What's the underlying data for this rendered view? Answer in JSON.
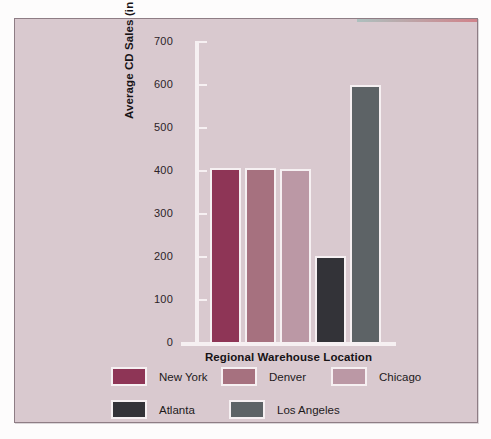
{
  "chart_data": {
    "type": "bar",
    "title": "",
    "xlabel": "Regional Warehouse Location",
    "ylabel": "Average CD Sales (in thousands)",
    "categories": [
      "New York",
      "Denver",
      "Chicago",
      "Atlanta",
      "Los Angeles"
    ],
    "values": [
      400,
      400,
      398,
      195,
      592
    ],
    "ylim": [
      0,
      700
    ],
    "yticks": [
      0,
      100,
      200,
      300,
      400,
      500,
      600,
      700
    ],
    "ytick_labels": [
      "0",
      "100",
      "200",
      "300",
      "400",
      "500",
      "600",
      "700"
    ],
    "grid": false,
    "legend_position": "bottom",
    "series": [
      {
        "name": "Average CD Sales",
        "values": [
          400,
          400,
          398,
          195,
          592
        ]
      }
    ],
    "colors": [
      "#8e3556",
      "#a6717f",
      "#bb98a5",
      "#333338",
      "#5d6366"
    ],
    "background": "#d9c9cf",
    "axis_color": "#f6f0f2"
  },
  "legend": {
    "rows": [
      [
        {
          "label": "New York",
          "color": "#8e3556"
        },
        {
          "label": "Denver",
          "color": "#a6717f"
        },
        {
          "label": "Chicago",
          "color": "#bb98a5"
        }
      ],
      [
        {
          "label": "Atlanta",
          "color": "#333338"
        },
        {
          "label": "Los Angeles",
          "color": "#5d6366"
        }
      ]
    ]
  }
}
